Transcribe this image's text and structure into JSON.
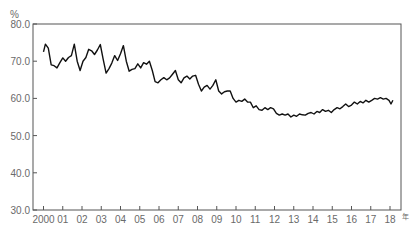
{
  "chart_data": {
    "type": "line",
    "title": "",
    "ylabel": "%",
    "xlabel": "年",
    "ylim": [
      30.0,
      80.0
    ],
    "yticks": [
      "30.0",
      "40.0",
      "50.0",
      "60.0",
      "70.0",
      "80.0"
    ],
    "xticks": [
      "2000",
      "01",
      "02",
      "03",
      "04",
      "05",
      "06",
      "07",
      "08",
      "09",
      "10",
      "11",
      "12",
      "13",
      "14",
      "15",
      "16",
      "17",
      "18"
    ],
    "grid": false,
    "legend": null,
    "series": [
      {
        "name": "series",
        "x": [
          2000.0,
          2000.1,
          2000.25,
          2000.4,
          2000.55,
          2000.7,
          2000.85,
          2001.0,
          2001.15,
          2001.3,
          2001.45,
          2001.6,
          2001.75,
          2001.9,
          2002.05,
          2002.2,
          2002.35,
          2002.5,
          2002.65,
          2002.8,
          2002.95,
          2003.1,
          2003.25,
          2003.4,
          2003.55,
          2003.7,
          2003.85,
          2004.0,
          2004.15,
          2004.3,
          2004.45,
          2004.6,
          2004.75,
          2004.9,
          2005.05,
          2005.2,
          2005.35,
          2005.5,
          2005.65,
          2005.8,
          2005.95,
          2006.1,
          2006.25,
          2006.4,
          2006.55,
          2006.7,
          2006.85,
          2007.0,
          2007.15,
          2007.3,
          2007.45,
          2007.6,
          2007.75,
          2007.9,
          2008.05,
          2008.2,
          2008.35,
          2008.5,
          2008.65,
          2008.8,
          2008.95,
          2009.1,
          2009.25,
          2009.4,
          2009.55,
          2009.7,
          2009.85,
          2010.0,
          2010.15,
          2010.3,
          2010.45,
          2010.6,
          2010.75,
          2010.9,
          2011.05,
          2011.2,
          2011.35,
          2011.5,
          2011.65,
          2011.8,
          2011.95,
          2012.1,
          2012.25,
          2012.4,
          2012.55,
          2012.7,
          2012.85,
          2013.0,
          2013.15,
          2013.3,
          2013.45,
          2013.6,
          2013.75,
          2013.9,
          2014.05,
          2014.2,
          2014.35,
          2014.5,
          2014.65,
          2014.8,
          2014.95,
          2015.1,
          2015.25,
          2015.4,
          2015.55,
          2015.7,
          2015.85,
          2016.0,
          2016.15,
          2016.3,
          2016.45,
          2016.6,
          2016.75,
          2016.9,
          2017.05,
          2017.2,
          2017.35,
          2017.5,
          2017.65,
          2017.8,
          2017.95,
          2018.05,
          2018.15
        ],
        "values": [
          72.5,
          74.6,
          73.5,
          69.0,
          68.8,
          68.2,
          69.6,
          70.9,
          70.0,
          71.0,
          71.5,
          74.6,
          70.0,
          67.5,
          70.0,
          71.0,
          73.2,
          72.8,
          71.8,
          73.0,
          74.5,
          70.5,
          66.8,
          68.0,
          69.5,
          71.5,
          70.2,
          72.0,
          74.2,
          70.0,
          67.3,
          67.8,
          68.0,
          69.3,
          68.2,
          69.6,
          69.2,
          70.0,
          67.5,
          64.5,
          64.2,
          65.0,
          65.6,
          65.0,
          65.5,
          66.5,
          67.5,
          65.0,
          64.2,
          65.5,
          66.0,
          65.2,
          66.0,
          66.2,
          63.8,
          62.0,
          63.0,
          63.5,
          62.5,
          63.5,
          65.0,
          62.0,
          61.2,
          61.8,
          62.0,
          62.0,
          60.0,
          59.0,
          59.5,
          59.2,
          59.8,
          59.0,
          59.0,
          57.5,
          58.0,
          57.0,
          56.8,
          57.5,
          57.0,
          57.5,
          57.2,
          56.0,
          55.5,
          55.8,
          55.5,
          55.8,
          55.0,
          55.5,
          55.2,
          55.8,
          55.6,
          55.5,
          56.0,
          56.2,
          55.8,
          56.5,
          56.2,
          57.0,
          56.5,
          56.8,
          56.2,
          57.0,
          57.5,
          57.2,
          57.8,
          58.5,
          57.8,
          58.2,
          59.0,
          58.5,
          59.2,
          58.8,
          59.5,
          59.0,
          59.5,
          60.0,
          59.8,
          60.2,
          59.8,
          60.0,
          59.5,
          58.5,
          59.5
        ]
      }
    ]
  },
  "axis": {
    "y_unit": "%",
    "x_unit": "年"
  }
}
